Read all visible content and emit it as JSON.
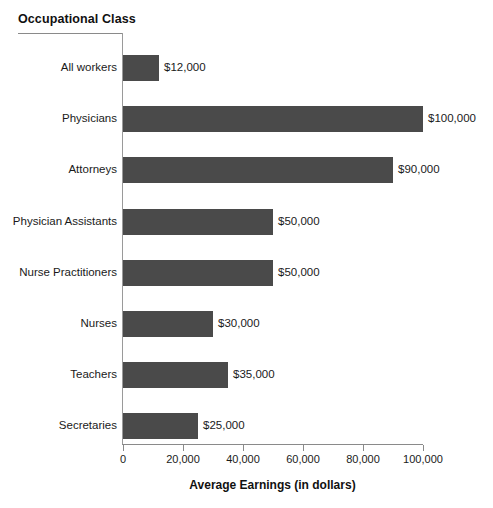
{
  "chart_data": {
    "type": "bar",
    "orientation": "horizontal",
    "title": "",
    "xlabel": "Average Earnings (in dollars)",
    "ylabel": "Occupational Class",
    "xlim": [
      0,
      100000
    ],
    "grid": false,
    "legend": null,
    "xticks": [
      {
        "value": 0,
        "label": "0"
      },
      {
        "value": 20000,
        "label": "20,000"
      },
      {
        "value": 40000,
        "label": "40,000"
      },
      {
        "value": 60000,
        "label": "60,000"
      },
      {
        "value": 80000,
        "label": "80,000"
      },
      {
        "value": 100000,
        "label": "100,000"
      }
    ],
    "categories": [
      "All workers",
      "Physicians",
      "Attorneys",
      "Physician Assistants",
      "Nurse Practitioners",
      "Nurses",
      "Teachers",
      "Secretaries"
    ],
    "values": [
      12000,
      100000,
      90000,
      50000,
      50000,
      30000,
      35000,
      25000
    ],
    "data_labels": [
      "$12,000",
      "$100,000",
      "$90,000",
      "$50,000",
      "$50,000",
      "$30,000",
      "$35,000",
      "$25,000"
    ],
    "bar_color": "#4a4a4a",
    "axis_color": "#8a8a8a",
    "background_color": "#ffffff"
  }
}
